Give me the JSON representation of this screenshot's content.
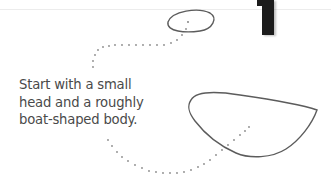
{
  "step": {
    "number": "1",
    "caption_lines": [
      "Start with a small",
      "head and a roughly",
      "boat-shaped body."
    ]
  },
  "colors": {
    "stroke": "#5a5a5a",
    "dots": "#777777",
    "text": "#4a4a4a",
    "step_number": "#1c1c1c"
  },
  "shapes": [
    {
      "name": "head-oval",
      "description": "small head oval"
    },
    {
      "name": "body-boat",
      "description": "boat-shaped body"
    }
  ]
}
